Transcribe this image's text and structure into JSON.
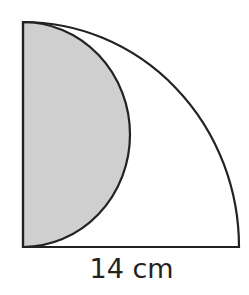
{
  "diagram": {
    "type": "geometry",
    "quarter_circle": {
      "radius_label": "14 cm",
      "stroke_color": "#222222"
    },
    "semicircle": {
      "shaded": true,
      "fill_color": "#cfcfcf",
      "stroke_color": "#222222"
    },
    "labels": {
      "base": "14 cm"
    }
  }
}
